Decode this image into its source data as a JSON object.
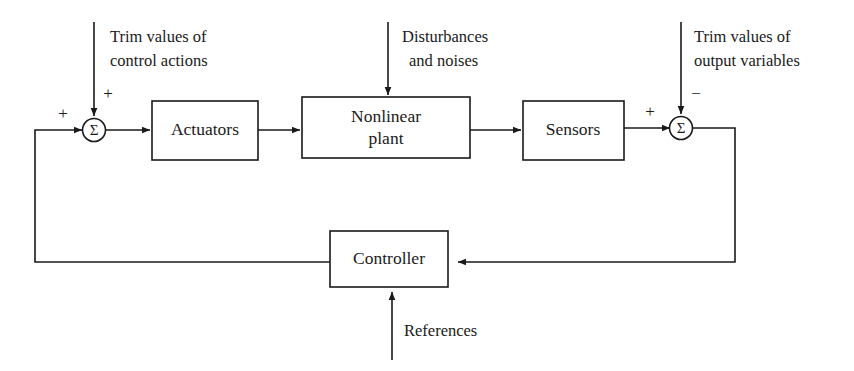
{
  "diagram": {
    "background_color": "#ffffff",
    "line_color": "#1a1a1a",
    "blocks": [
      {
        "id": "actuators",
        "label": "Actuators"
      },
      {
        "id": "plant",
        "label_line1": "Nonlinear",
        "label_line2": "plant"
      },
      {
        "id": "sensors",
        "label": "Sensors"
      },
      {
        "id": "controller",
        "label": "Controller"
      }
    ],
    "summing_junctions": [
      {
        "id": "left-sum",
        "symbol": "Σ",
        "sign_horizontal": "+",
        "sign_vertical": "+"
      },
      {
        "id": "right-sum",
        "symbol": "Σ",
        "sign_horizontal": "+",
        "sign_vertical": "−"
      }
    ],
    "annotations": [
      {
        "id": "trim-control-actions",
        "line1": "Trim values of",
        "line2": "control actions"
      },
      {
        "id": "disturbances-noises",
        "line1": "Disturbances",
        "line2": "and noises"
      },
      {
        "id": "trim-output-variables",
        "line1": "Trim values of",
        "line2": "output variables"
      },
      {
        "id": "references",
        "line1": "References"
      }
    ]
  }
}
